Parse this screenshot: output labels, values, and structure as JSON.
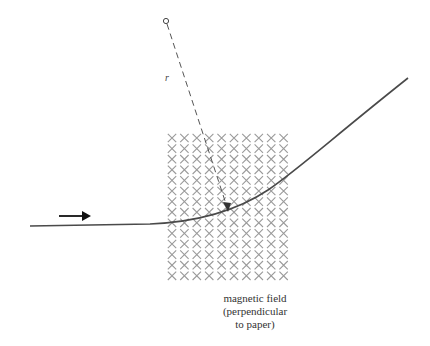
{
  "figure": {
    "radius_label": "r",
    "caption_lines": [
      "magnetic field",
      "(perpendicular",
      "to paper)"
    ],
    "field_grid": {
      "columns": 10,
      "rows": 14,
      "x0": 172,
      "y0": 138,
      "dx": 12.4,
      "dy": 10.6,
      "symbol": "x-mark",
      "color": "#9a9a9a"
    },
    "trajectory_color": "#4a4a4a",
    "center_marker": "small-open-circle",
    "direction_arrow": "right-arrow"
  }
}
